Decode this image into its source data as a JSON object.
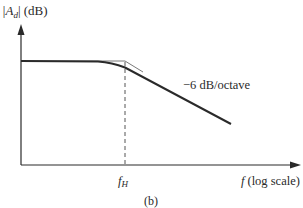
{
  "figure": {
    "y_axis_label_main": "|A",
    "y_axis_label_sub": "d",
    "y_axis_label_bar": "|",
    "y_axis_unit": "(dB)",
    "x_axis_label_var": "f",
    "x_axis_label_note": "(log scale)",
    "corner_label_main": "f",
    "corner_label_sub": "H",
    "slope_label": "−6 dB/octave",
    "caption": "(b)"
  },
  "colors": {
    "axis": "#2a2a2a",
    "curve": "#2a2a2a",
    "asymptote": "#6a6a6a",
    "dashed": "#555555"
  }
}
